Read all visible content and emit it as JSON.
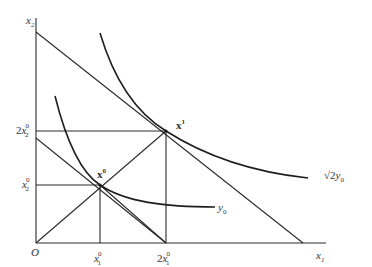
{
  "diagram": {
    "type": "homothetic-isoquant-diagram",
    "axes": {
      "origin_label": "O",
      "x_label": "x",
      "x_sub": "1",
      "y_label": "x",
      "y_sub": "2"
    },
    "x_ticks": [
      {
        "coef": "",
        "base": "x",
        "sup": "0",
        "sub": "1"
      },
      {
        "coef": "2",
        "base": "x",
        "sup": "0",
        "sub": "1"
      }
    ],
    "y_ticks": [
      {
        "coef": "",
        "base": "x",
        "sup": "0",
        "sub": "2"
      },
      {
        "coef": "2",
        "base": "x",
        "sup": "0",
        "sub": "2"
      }
    ],
    "points": [
      {
        "base": "x",
        "sup": "0"
      },
      {
        "base": "x",
        "sup": "1"
      }
    ],
    "curves": [
      {
        "label_prefix": "",
        "label_base": "y",
        "label_sub": "0"
      },
      {
        "label_prefix": "√2",
        "label_base": "y",
        "label_sub": "0"
      }
    ],
    "colors": {
      "line": "#2a2a2a",
      "text": "#333333",
      "background": "#ffffff"
    }
  }
}
